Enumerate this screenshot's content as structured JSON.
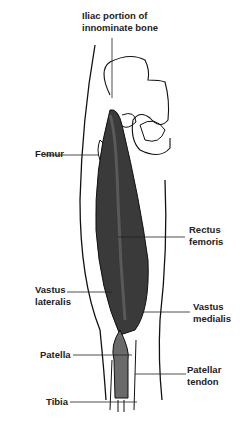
{
  "diagram": {
    "labels": [
      {
        "id": "iliac",
        "line1": "Iliac portion of",
        "line2": "innominate bone"
      },
      {
        "id": "femur",
        "line1": "Femur"
      },
      {
        "id": "rectus",
        "line1": "Rectus",
        "line2": "femoris"
      },
      {
        "id": "vlat",
        "line1": "Vastus",
        "line2": "lateralis"
      },
      {
        "id": "vmed",
        "line1": "Vastus",
        "line2": "medialis"
      },
      {
        "id": "patella",
        "line1": "Patella"
      },
      {
        "id": "ptendon",
        "line1": "Patellar",
        "line2": "tendon"
      },
      {
        "id": "tibia",
        "line1": "Tibia"
      }
    ],
    "colors": {
      "muscle": "#3a3a3a",
      "muscle_light": "#6a6a6a",
      "outline": "#111111",
      "background": "#ffffff"
    }
  }
}
